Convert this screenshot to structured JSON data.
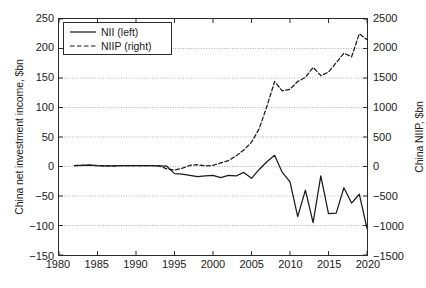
{
  "chart_data": {
    "type": "line",
    "title": "",
    "xlabel": "",
    "ylabel": "China net investment income, $bn",
    "ylabel_right": "China NIIP, $bn",
    "xlim": [
      1980,
      2020
    ],
    "ylim": [
      -150,
      250
    ],
    "ylim_right": [
      -1500,
      2500
    ],
    "xticks": [
      1980,
      1985,
      1990,
      1995,
      2000,
      2005,
      2010,
      2015,
      2020
    ],
    "xtick_labels": [
      "1980",
      "1985",
      "1990",
      "1995",
      "2000",
      "2005",
      "2010",
      "2015",
      "2020"
    ],
    "yticks_left": [
      -150,
      -100,
      -50,
      0,
      50,
      100,
      150,
      200,
      250
    ],
    "ytick_labels_left": [
      "−150",
      "−100",
      "−50",
      "0",
      "50",
      "100",
      "150",
      "200",
      "250"
    ],
    "yticks_right": [
      -1500,
      -1000,
      -500,
      0,
      500,
      1000,
      1500,
      2000,
      2500
    ],
    "ytick_labels_right": [
      "−1500",
      "−1000",
      "−500",
      "0",
      "500",
      "1000",
      "1500",
      "2000",
      "2500"
    ],
    "grid": true,
    "grid_style": "dotted",
    "legend_position": "upper left",
    "series": [
      {
        "name": "NII (left)",
        "axis": "left",
        "style": "solid",
        "color": "#1a1a1a",
        "x": [
          1982,
          1983,
          1984,
          1985,
          1986,
          1987,
          1988,
          1989,
          1990,
          1991,
          1992,
          1993,
          1994,
          1995,
          1996,
          1997,
          1998,
          1999,
          2000,
          2001,
          2002,
          2003,
          2004,
          2005,
          2006,
          2007,
          2008,
          2009,
          2010,
          2011,
          2012,
          2013,
          2014,
          2015,
          2016,
          2017,
          2018,
          2019,
          2020
        ],
        "values": [
          1.5,
          2.0,
          2.5,
          1.5,
          1.0,
          1.0,
          1.5,
          1.5,
          1.5,
          1.5,
          1.5,
          1.0,
          0.5,
          -12.0,
          -13.0,
          -15.0,
          -17.0,
          -16.0,
          -15.0,
          -19.0,
          -15.0,
          -16.0,
          -10.0,
          -20.0,
          -5.0,
          8.0,
          19.0,
          -10.0,
          -26.0,
          -85.0,
          -40.0,
          -95.0,
          -16.0,
          -80.0,
          -79.0,
          -36.0,
          -62.0,
          -47.0,
          -105.0
        ]
      },
      {
        "name": "NIIP (right)",
        "axis": "right",
        "style": "dashed",
        "color": "#1a1a1a",
        "x": [
          1982,
          1983,
          1984,
          1985,
          1986,
          1987,
          1988,
          1989,
          1990,
          1991,
          1992,
          1993,
          1994,
          1995,
          1996,
          1997,
          1998,
          1999,
          2000,
          2001,
          2002,
          2003,
          2004,
          2005,
          2006,
          2007,
          2008,
          2009,
          2010,
          2011,
          2012,
          2013,
          2014,
          2015,
          2016,
          2017,
          2018,
          2019,
          2020
        ],
        "values": [
          15,
          20,
          25,
          15,
          10,
          10,
          15,
          15,
          15,
          15,
          15,
          10,
          -40,
          -60,
          -30,
          20,
          30,
          10,
          20,
          60,
          100,
          180,
          280,
          410,
          640,
          1020,
          1440,
          1280,
          1310,
          1440,
          1510,
          1680,
          1540,
          1600,
          1760,
          1920,
          1860,
          2250,
          2150
        ]
      }
    ],
    "legend_entries": [
      "NII (left)",
      "NIIP (right)"
    ]
  },
  "axes": {
    "left_axis_title": "China net investment income, $bn",
    "right_axis_title": "China NIIP, $bn"
  },
  "colors": {
    "line": "#1a1a1a",
    "grid": "#9a9a9a",
    "frame": "#2b2b2b",
    "background": "#ffffff"
  }
}
